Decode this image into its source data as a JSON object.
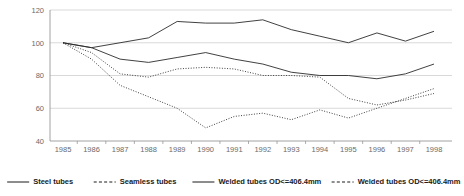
{
  "chart_data": {
    "type": "line",
    "title": "",
    "subtitle": "",
    "xlabel": "",
    "ylabel": "",
    "x": [
      1985,
      1986,
      1987,
      1988,
      1989,
      1990,
      1991,
      1992,
      1993,
      1994,
      1995,
      1996,
      1997,
      1998
    ],
    "categories": [
      "1985",
      "1986",
      "1987",
      "1988",
      "1989",
      "1990",
      "1991",
      "1992",
      "1993",
      "1994",
      "1995",
      "1996",
      "1997",
      "1998"
    ],
    "xlim": [
      1985,
      1998
    ],
    "ylim": [
      40,
      120
    ],
    "yticks": [
      40,
      60,
      80,
      100,
      120
    ],
    "ytick_labels": [
      "40",
      "60",
      "80",
      "100",
      "120"
    ],
    "grid": true,
    "grid_axis": "y",
    "legend_position": "bottom",
    "series": [
      {
        "name": "Steel tubes",
        "style": "solid",
        "values": [
          100,
          97,
          90,
          88,
          91,
          94,
          90,
          87,
          82,
          80,
          80,
          78,
          81,
          87
        ]
      },
      {
        "name": "Seamless tubes",
        "style": "dashed",
        "values": [
          100,
          90,
          74,
          67,
          60,
          48,
          55,
          57,
          53,
          59,
          54,
          60,
          66,
          72
        ]
      },
      {
        "name": "Welded tubes OD<=406.4mm",
        "style": "solid",
        "values": [
          100,
          97,
          100,
          103,
          113,
          112,
          112,
          114,
          108,
          104,
          100,
          106,
          101,
          107
        ]
      },
      {
        "name": "Welded tubes OD<=406.4mm",
        "style": "dashed",
        "values": [
          100,
          94,
          81,
          79,
          84,
          85,
          84,
          80,
          80,
          79,
          66,
          62,
          65,
          69
        ]
      }
    ]
  },
  "legend": {
    "items": [
      {
        "label": "Steel tubes",
        "style": "solid"
      },
      {
        "label": "Seamless tubes",
        "style": "dashed"
      },
      {
        "label": "Welded tubes OD<=406.4mm",
        "style": "solid"
      },
      {
        "label": "Welded tubes OD<=406.4mm",
        "style": "dashed"
      }
    ]
  },
  "colors": {
    "line": "#2b2b2b",
    "grid": "#c8c8c8",
    "axis": "#8a8a8a",
    "tick_text": "#6a6a6a",
    "legend_text": "#1a1a1a",
    "background": "#ffffff"
  }
}
